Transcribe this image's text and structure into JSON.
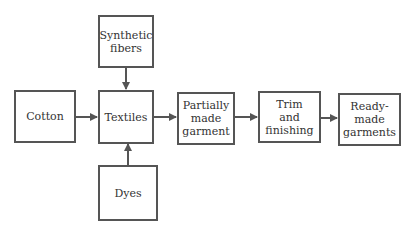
{
  "nodes": {
    "synthetic": "Synthetic fibers",
    "cotton": "Cotton",
    "textiles": "Textiles",
    "dyes": "Dyes",
    "partial": "Partially made garment",
    "trim": "Trim and finishing",
    "ready": "Ready-made garments"
  },
  "edges": [
    [
      "Synthetic fibers",
      "Textiles"
    ],
    [
      "Cotton",
      "Textiles"
    ],
    [
      "Dyes",
      "Textiles"
    ],
    [
      "Textiles",
      "Partially made garment"
    ],
    [
      "Partially made garment",
      "Trim and finishing"
    ],
    [
      "Trim and finishing",
      "Ready-made garments"
    ]
  ],
  "colors": {
    "stroke": "#555555",
    "text": "#333333"
  }
}
